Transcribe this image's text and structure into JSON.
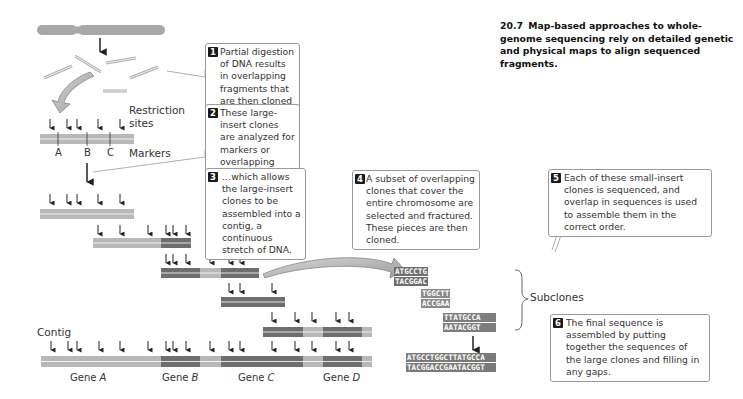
{
  "figure": {
    "number": "20.7",
    "caption": "Map-based approaches to whole-genome sequencing rely on detailed genetic and physical maps to align sequenced fragments."
  },
  "steps": [
    {
      "num": "1",
      "text": "Partial digestion of DNA results in overlapping fragments that are then cloned in bacteria."
    },
    {
      "num": "2",
      "text": "These large-insert clones are analyzed for markers or overlapping restriction sites,…"
    },
    {
      "num": "3",
      "text": "…which allows the large-insert clones to be assembled into a contig, a continuous stretch of DNA."
    },
    {
      "num": "4",
      "text": "A subset of overlapping clones that cover the entire chromosome are selected and fractured. These pieces are then cloned."
    },
    {
      "num": "5",
      "text": "Each of these small-insert clones is sequenced, and overlap in sequences is used to assemble them in the correct order."
    },
    {
      "num": "6",
      "text": "The final sequence is assembled by putting together the sequences of the large clones and filling in any gaps."
    }
  ],
  "labels": {
    "restriction_sites_1": "Restriction",
    "restriction_sites_2": "sites",
    "markers": "Markers",
    "marker_a": "A",
    "marker_b": "B",
    "marker_c": "C",
    "contig": "Contig",
    "subclones": "Subclones"
  },
  "genes": [
    {
      "prefix": "Gene ",
      "name": "A"
    },
    {
      "prefix": "Gene ",
      "name": "B"
    },
    {
      "prefix": "Gene ",
      "name": "C"
    },
    {
      "prefix": "Gene ",
      "name": "D"
    }
  ],
  "subclones": [
    {
      "top": "ATGCCTG",
      "bottom": "TACGGAC"
    },
    {
      "top": "TGGCTT",
      "bottom": "ACCGAA"
    },
    {
      "top": "TTATGCCA",
      "bottom": "AATACGGT"
    }
  ],
  "final_sequence": {
    "top": "ATGCCTGGCTTATGCCA",
    "bottom": "TACGGACCGAATACGGT"
  },
  "colors": {
    "light_clone": "#b8b8b8",
    "dark_clone": "#6e6e6e",
    "chromosome": "#a8a8a8",
    "arrow": "#222222",
    "callout_border": "#9a9a9a"
  }
}
